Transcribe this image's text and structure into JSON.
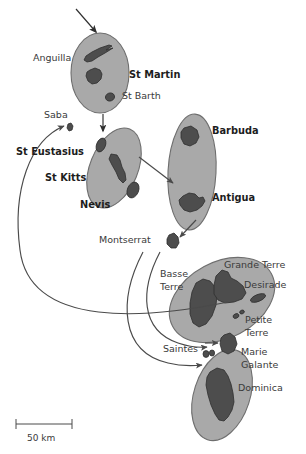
{
  "map": {
    "title": "Lesser Antilles island-group map",
    "colors": {
      "background": "#ffffff",
      "ellipse_fill": "#a9a9a9",
      "ellipse_stroke": "#6e6e6e",
      "island_fill": "#4d4d4d",
      "island_stroke": "#2f2f2f",
      "arrow": "#4a4a4a",
      "label": "#3a3a3a",
      "label_bold": "#1d1d1d"
    },
    "labels": [
      {
        "id": "anguilla",
        "text": "Anguilla",
        "x": 33,
        "y": 61,
        "weight": "regular",
        "anchor": "start"
      },
      {
        "id": "st-martin",
        "text": "St Martin",
        "x": 129,
        "y": 78,
        "weight": "bold",
        "anchor": "start"
      },
      {
        "id": "st-barth",
        "text": "St Barth",
        "x": 122,
        "y": 99,
        "weight": "regular",
        "anchor": "start"
      },
      {
        "id": "saba",
        "text": "Saba",
        "x": 44,
        "y": 118,
        "weight": "regular",
        "anchor": "start"
      },
      {
        "id": "barbuda",
        "text": "Barbuda",
        "x": 212,
        "y": 134,
        "weight": "bold",
        "anchor": "start"
      },
      {
        "id": "st-eustasius",
        "text": "St Eustasius",
        "x": 16,
        "y": 155,
        "weight": "bold",
        "anchor": "start"
      },
      {
        "id": "st-kitts",
        "text": "St Kitts",
        "x": 45,
        "y": 181,
        "weight": "bold",
        "anchor": "start"
      },
      {
        "id": "antigua",
        "text": "Antigua",
        "x": 212,
        "y": 201,
        "weight": "bold",
        "anchor": "start"
      },
      {
        "id": "nevis",
        "text": "Nevis",
        "x": 80,
        "y": 208,
        "weight": "bold",
        "anchor": "start"
      },
      {
        "id": "montserrat",
        "text": "Montserrat",
        "x": 99,
        "y": 243,
        "weight": "regular",
        "anchor": "start"
      },
      {
        "id": "grande-terre",
        "text": "Grande Terre",
        "x": 224,
        "y": 268,
        "weight": "regular",
        "anchor": "start"
      },
      {
        "id": "basse",
        "text": "Basse",
        "x": 160,
        "y": 277,
        "weight": "regular",
        "anchor": "start"
      },
      {
        "id": "desirade",
        "text": "Desirade",
        "x": 244,
        "y": 288,
        "weight": "regular",
        "anchor": "start"
      },
      {
        "id": "terre",
        "text": "Terre",
        "x": 160,
        "y": 290,
        "weight": "regular",
        "anchor": "start"
      },
      {
        "id": "petite",
        "text": "Petite",
        "x": 245,
        "y": 323,
        "weight": "regular",
        "anchor": "start"
      },
      {
        "id": "terre2",
        "text": "Terre",
        "x": 245,
        "y": 336,
        "weight": "regular",
        "anchor": "start"
      },
      {
        "id": "saintes",
        "text": "Saintes",
        "x": 163,
        "y": 352,
        "weight": "regular",
        "anchor": "start"
      },
      {
        "id": "marie",
        "text": "Marie",
        "x": 241,
        "y": 355,
        "weight": "regular",
        "anchor": "start"
      },
      {
        "id": "galante",
        "text": "Galante",
        "x": 241,
        "y": 368,
        "weight": "regular",
        "anchor": "start"
      },
      {
        "id": "dominica",
        "text": "Dominica",
        "x": 238,
        "y": 391,
        "weight": "regular",
        "anchor": "start"
      }
    ],
    "island_groups": [
      {
        "id": "st-martin-group",
        "members": [
          "Anguilla",
          "St Martin",
          "St Barth"
        ]
      },
      {
        "id": "st-kitts-group",
        "members": [
          "St Eustasius",
          "St Kitts",
          "Nevis"
        ]
      },
      {
        "id": "antigua-group",
        "members": [
          "Barbuda",
          "Antigua"
        ]
      },
      {
        "id": "guadeloupe-group",
        "members": [
          "Basse Terre",
          "Grande Terre",
          "Desirade",
          "Petite Terre"
        ]
      },
      {
        "id": "dominica-group",
        "members": [
          "Saintes",
          "Dominica"
        ]
      },
      {
        "id": "saba-single",
        "members": [
          "Saba"
        ]
      },
      {
        "id": "montserrat-single",
        "members": [
          "Montserrat"
        ]
      },
      {
        "id": "marie-galante-single",
        "members": [
          "Marie Galante"
        ]
      }
    ],
    "scale_bar": {
      "label": "50 km",
      "x1": 16,
      "x2": 72,
      "y": 424,
      "text_x": 27,
      "text_y": 441
    }
  }
}
